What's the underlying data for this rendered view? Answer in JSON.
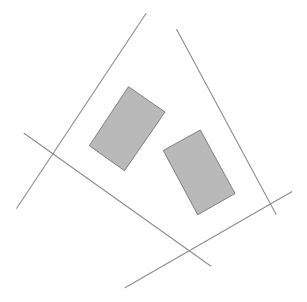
{
  "diagram": {
    "width": 307,
    "height": 302,
    "background": "#ffffff",
    "line_color": "#8c8c8c",
    "line_width": 1.1,
    "rect_fill": "#b9b9b9",
    "rect_stroke": "#7f7f7f",
    "lines": [
      {
        "id": "line-a",
        "x1": 146,
        "y1": 13.5,
        "x2": 16.7,
        "y2": 208.3
      },
      {
        "id": "line-b",
        "x1": 176.7,
        "y1": 29.5,
        "x2": 276,
        "y2": 214.3
      },
      {
        "id": "line-c",
        "x1": 24,
        "y1": 133.3,
        "x2": 210.7,
        "y2": 266
      },
      {
        "id": "line-d",
        "x1": 125,
        "y1": 287.7,
        "x2": 291.7,
        "y2": 191.7
      }
    ],
    "rectangles": [
      {
        "id": "rect-1",
        "points": "128.5,86.7 165,112 124.5,170.7 89.3,145.7"
      },
      {
        "id": "rect-2",
        "points": "163.3,150.5 200.3,130 235,193.5 197.7,214.8"
      }
    ]
  }
}
